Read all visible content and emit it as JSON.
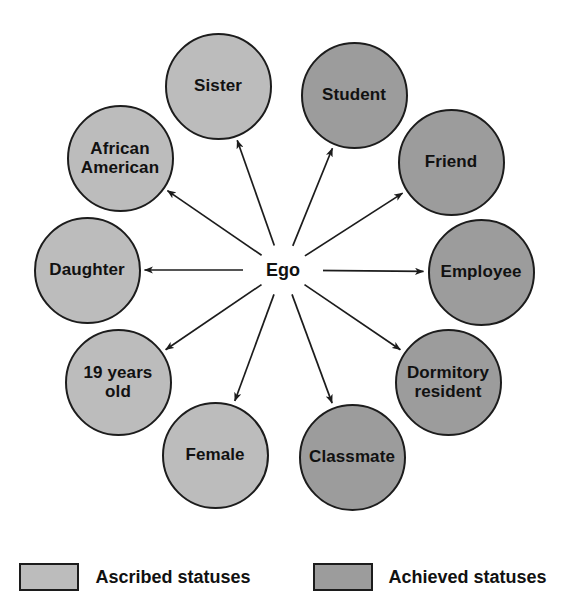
{
  "diagram": {
    "center": {
      "label": "Ego",
      "x": 283,
      "y": 270
    },
    "node_diameter": 107,
    "colors": {
      "ascribed_fill": "#bcbcbc",
      "achieved_fill": "#9c9c9c",
      "outline": "#1c1c1c",
      "arrow": "#1c1c1c",
      "background": "#ffffff",
      "text": "#111111"
    },
    "nodes": [
      {
        "id": "sister",
        "label": "Sister",
        "category": "ascribed",
        "x": 218,
        "y": 86
      },
      {
        "id": "student",
        "label": "Student",
        "category": "achieved",
        "x": 354,
        "y": 95
      },
      {
        "id": "african-american",
        "label": "African\nAmerican",
        "category": "ascribed",
        "x": 120,
        "y": 158
      },
      {
        "id": "friend",
        "label": "Friend",
        "category": "achieved",
        "x": 451,
        "y": 162
      },
      {
        "id": "daughter",
        "label": "Daughter",
        "category": "ascribed",
        "x": 87,
        "y": 270
      },
      {
        "id": "employee",
        "label": "Employee",
        "category": "achieved",
        "x": 481,
        "y": 272
      },
      {
        "id": "nineteen-years-old",
        "label": "19 years\nold",
        "category": "ascribed",
        "x": 118,
        "y": 382
      },
      {
        "id": "dormitory-resident",
        "label": "Dormitory\nresident",
        "category": "achieved",
        "x": 448,
        "y": 382
      },
      {
        "id": "female",
        "label": "Female",
        "category": "ascribed",
        "x": 215,
        "y": 455
      },
      {
        "id": "classmate",
        "label": "Classmate",
        "category": "achieved",
        "x": 352,
        "y": 457
      }
    ]
  },
  "legend": {
    "y": 563,
    "items": [
      {
        "id": "ascribed",
        "label": "Ascribed statuses",
        "category": "ascribed"
      },
      {
        "id": "achieved",
        "label": "Achieved statuses",
        "category": "achieved"
      }
    ]
  }
}
